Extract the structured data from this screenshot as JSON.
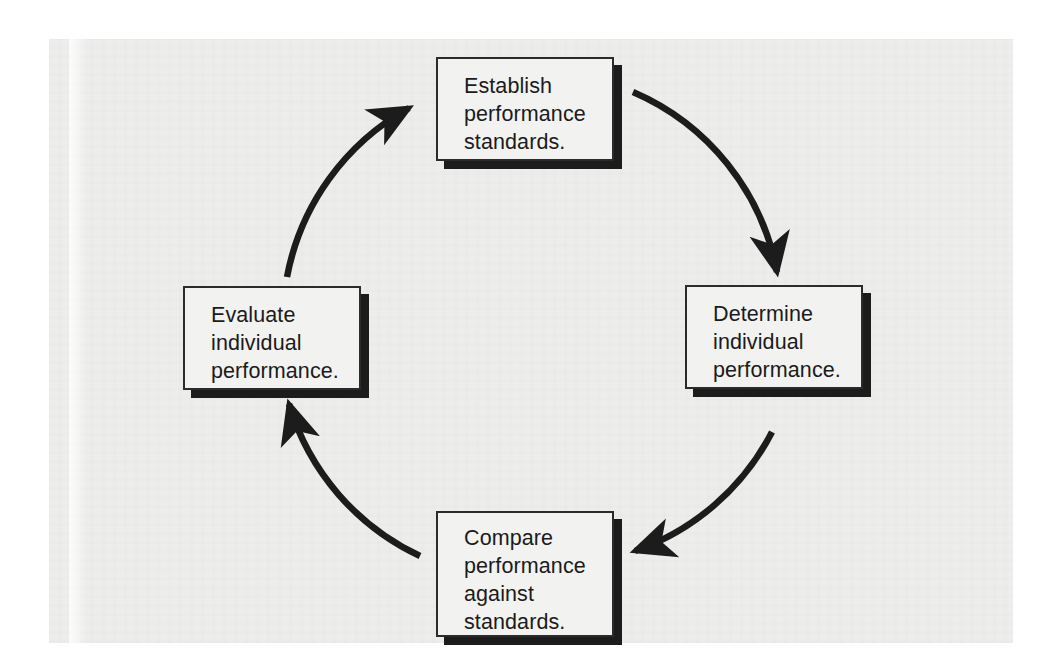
{
  "diagram": {
    "type": "cycle",
    "direction": "clockwise",
    "background_color": "#ededec",
    "box_fill_color": "#f2f2f1",
    "line_color": "#1c1c1c",
    "nodes": [
      {
        "id": "establish",
        "label": "Establish\nperformance\nstandards.",
        "position": "top"
      },
      {
        "id": "determine",
        "label": "Determine\nindividual\nperformance.",
        "position": "right"
      },
      {
        "id": "compare",
        "label": "Compare\nperformance\nagainst\nstandards.",
        "position": "bottom"
      },
      {
        "id": "evaluate",
        "label": "Evaluate\nindividual\nperformance.",
        "position": "left"
      }
    ],
    "edges": [
      {
        "id": "edge-establish-determine",
        "from": "establish",
        "to": "determine",
        "style": "curved-arrow",
        "arrow_direction": "down"
      },
      {
        "id": "edge-determine-compare",
        "from": "determine",
        "to": "compare",
        "style": "curved-arrow",
        "arrow_direction": "left"
      },
      {
        "id": "edge-compare-evaluate",
        "from": "compare",
        "to": "evaluate",
        "style": "curved-arrow",
        "arrow_direction": "up"
      },
      {
        "id": "edge-evaluate-establish",
        "from": "evaluate",
        "to": "establish",
        "style": "curved-arrow",
        "arrow_direction": "up-right"
      }
    ]
  }
}
